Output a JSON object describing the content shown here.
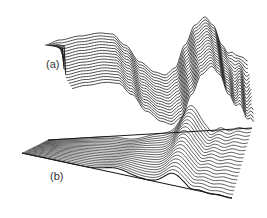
{
  "figure": {
    "panels": [
      {
        "id": "a",
        "label": "(a)",
        "type": "3d waterfall line surface"
      },
      {
        "id": "b",
        "label": "(b)",
        "type": "3d waterfall line surface on inclined plane"
      }
    ]
  },
  "chart_data": [
    {
      "type": "line",
      "title": "(a)",
      "description": "Stacked 3D waterfall traces of an oscillating wave packet",
      "series_count": 18,
      "front_trace": {
        "x": [
          45,
          60,
          80,
          100,
          112,
          125,
          140,
          155,
          165,
          175,
          185,
          195,
          205,
          213,
          222,
          230,
          236,
          242,
          248
        ],
        "y": [
          45,
          40,
          36,
          33,
          34,
          45,
          62,
          72,
          75,
          68,
          45,
          25,
          17,
          25,
          45,
          55,
          52,
          60,
          58
        ]
      },
      "offset_per_trace": {
        "dx": 1.3,
        "dy": 2.9
      },
      "xlabel": "",
      "ylabel": ""
    },
    {
      "type": "line",
      "title": "(b)",
      "description": "Stacked 3D waterfall traces on an inclined plane showing a hump and trailing ripples",
      "series_count": 20,
      "xlabel": "",
      "ylabel": ""
    }
  ]
}
